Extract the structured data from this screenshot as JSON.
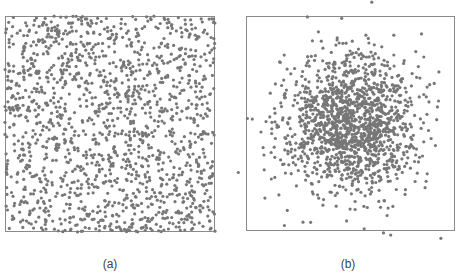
{
  "chart_data": [
    {
      "type": "scatter",
      "title": "",
      "caption": "(a)",
      "description": "Uniformly distributed random points filling the square",
      "distribution": "uniform",
      "n_points": 1500,
      "xlim": [
        0,
        1
      ],
      "ylim": [
        0,
        1
      ],
      "xlabel": "",
      "ylabel": "",
      "grid": false,
      "legend": null,
      "marker_color": "#777777",
      "marker_radius": 1.6,
      "seed": 12345
    },
    {
      "type": "scatter",
      "title": "",
      "caption": "(b)",
      "description": "Gaussian (normally) distributed random points concentrated around the center; some points fall outside the frame",
      "distribution": "gaussian",
      "n_points": 1500,
      "center": [
        0.5,
        0.5
      ],
      "std": [
        0.16,
        0.16
      ],
      "xlim": [
        0,
        1
      ],
      "ylim": [
        0,
        1
      ],
      "xlabel": "",
      "ylabel": "",
      "grid": false,
      "legend": null,
      "marker_color": "#777777",
      "marker_radius": 1.6,
      "seed": 67890
    }
  ],
  "captions": {
    "a": "(a)",
    "b": "(b)"
  },
  "frame_color": "#8a8a8a"
}
